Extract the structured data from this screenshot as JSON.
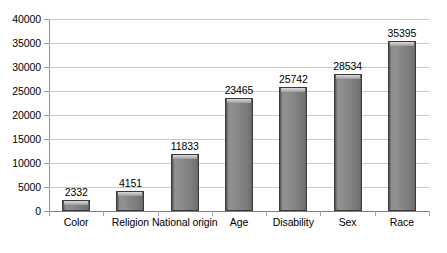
{
  "chart_data": {
    "type": "bar",
    "title": "",
    "subtitle": "",
    "xlabel": "",
    "ylabel": "",
    "categories": [
      "Color",
      "Religion",
      "National origin",
      "Age",
      "Disability",
      "Sex",
      "Race"
    ],
    "values": [
      2332,
      4151,
      11833,
      23465,
      25742,
      28534,
      35395
    ],
    "value_labels": [
      "2332",
      "4151",
      "11833",
      "23465",
      "25742",
      "28534",
      "35395"
    ],
    "ylim": [
      0,
      40000
    ],
    "ytick_step": 5000,
    "ytick_labels": [
      "40000",
      "35000",
      "30000",
      "25000",
      "20000",
      "15000",
      "10000",
      "5000",
      "0"
    ],
    "ytick_values": [
      40000,
      35000,
      30000,
      25000,
      20000,
      15000,
      10000,
      5000,
      0
    ],
    "grid": "horizontal",
    "legend": "none",
    "series": [
      {
        "name": "",
        "values": [
          2332,
          4151,
          11833,
          23465,
          25742,
          28534,
          35395
        ]
      }
    ],
    "colors": {
      "bar_fill": "#878787",
      "bar_edge": "#3a3a3a",
      "bar_highlight": "#c8c8c8",
      "gridline": "#c9c9c9",
      "axis": "#7d7d7d",
      "text": "#000000",
      "background": "#ffffff"
    }
  }
}
